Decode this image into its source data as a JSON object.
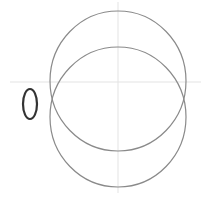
{
  "diagram": {
    "background": "#ffffff",
    "axes": {
      "color": "#e3e3e3",
      "horizontal": {
        "x1": 10,
        "y1": 82,
        "x2": 201,
        "y2": 82
      },
      "vertical": {
        "x1": 118,
        "y1": 2,
        "x2": 118,
        "y2": 193
      }
    },
    "circles": [
      {
        "name": "upper-circle",
        "cx": 118,
        "cy": 81,
        "rx": 68,
        "ry": 70,
        "stroke": "#8a8a8a"
      },
      {
        "name": "lower-circle",
        "cx": 118,
        "cy": 117,
        "rx": 68,
        "ry": 70,
        "stroke": "#8a8a8a"
      }
    ],
    "small_ellipse": {
      "cx": 30,
      "cy": 104,
      "rx": 7,
      "ry": 15,
      "stroke": "#333333"
    }
  }
}
